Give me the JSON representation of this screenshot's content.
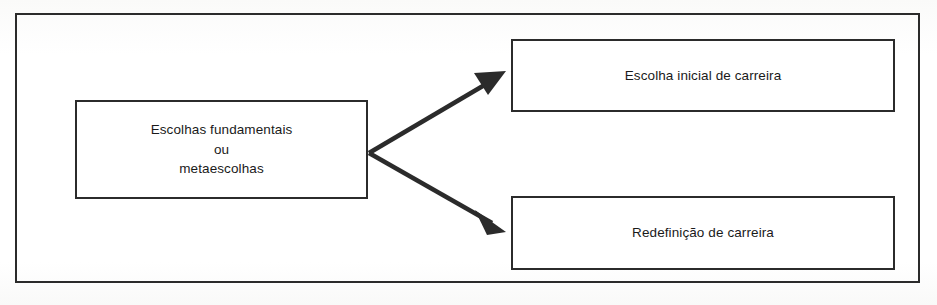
{
  "figure": {
    "frame_color": "#2b2b2b",
    "background_color": "#ffffff",
    "text_color": "#1a1a1a"
  },
  "nodes": [
    {
      "id": "root",
      "label": "Escolhas fundamentais\nou\nmetaescolhas",
      "lines": [
        "Escolhas fundamentais",
        "ou",
        "metaescolhas"
      ]
    },
    {
      "id": "initial",
      "label": "Escolha inicial de carreira",
      "lines": [
        "Escolha inicial de carreira"
      ]
    },
    {
      "id": "redefine",
      "label": "Redefinição de carreira",
      "lines": [
        "Redefinição de carreira"
      ]
    }
  ],
  "connectors": [
    {
      "id": "arrow-root-to-initial",
      "from": "root",
      "to": "initial",
      "style": "solid-filled-arrowhead",
      "direction": "up-right"
    },
    {
      "id": "arrow-root-to-redefine",
      "from": "root",
      "to": "redefine",
      "style": "solid-filled-arrowhead",
      "direction": "down-right"
    }
  ],
  "caption": {
    "remnant": ""
  }
}
